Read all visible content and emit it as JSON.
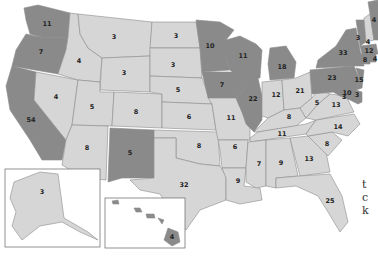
{
  "map": {
    "type": "US electoral votes by state",
    "colors": {
      "dark": "#8a8a8a",
      "light": "#d6d6d6",
      "border": "#8c8c8c",
      "label": "#222222"
    },
    "states": [
      {
        "id": "WA",
        "votes": "11",
        "shade": "dark"
      },
      {
        "id": "OR",
        "votes": "7",
        "shade": "dark"
      },
      {
        "id": "CA",
        "votes": "54",
        "shade": "dark"
      },
      {
        "id": "ID",
        "votes": "4",
        "shade": "light"
      },
      {
        "id": "NV",
        "votes": "4",
        "shade": "light"
      },
      {
        "id": "MT",
        "votes": "3",
        "shade": "light"
      },
      {
        "id": "WY",
        "votes": "3",
        "shade": "light"
      },
      {
        "id": "UT",
        "votes": "5",
        "shade": "light"
      },
      {
        "id": "AZ",
        "votes": "8",
        "shade": "light"
      },
      {
        "id": "CO",
        "votes": "8",
        "shade": "light"
      },
      {
        "id": "NM",
        "votes": "5",
        "shade": "dark"
      },
      {
        "id": "ND",
        "votes": "3",
        "shade": "light"
      },
      {
        "id": "SD",
        "votes": "3",
        "shade": "light"
      },
      {
        "id": "NE",
        "votes": "5",
        "shade": "light"
      },
      {
        "id": "KS",
        "votes": "6",
        "shade": "light"
      },
      {
        "id": "OK",
        "votes": "8",
        "shade": "light"
      },
      {
        "id": "TX",
        "votes": "32",
        "shade": "light"
      },
      {
        "id": "MN",
        "votes": "10",
        "shade": "dark"
      },
      {
        "id": "IA",
        "votes": "7",
        "shade": "dark"
      },
      {
        "id": "MO",
        "votes": "11",
        "shade": "light"
      },
      {
        "id": "AR",
        "votes": "6",
        "shade": "light"
      },
      {
        "id": "LA",
        "votes": "9",
        "shade": "light"
      },
      {
        "id": "WI",
        "votes": "11",
        "shade": "dark"
      },
      {
        "id": "IL",
        "votes": "22",
        "shade": "dark"
      },
      {
        "id": "MI",
        "votes": "18",
        "shade": "dark"
      },
      {
        "id": "IN",
        "votes": "12",
        "shade": "light"
      },
      {
        "id": "OH",
        "votes": "21",
        "shade": "light"
      },
      {
        "id": "KY",
        "votes": "8",
        "shade": "light"
      },
      {
        "id": "TN",
        "votes": "11",
        "shade": "light"
      },
      {
        "id": "MS",
        "votes": "7",
        "shade": "light"
      },
      {
        "id": "AL",
        "votes": "9",
        "shade": "light"
      },
      {
        "id": "GA",
        "votes": "13",
        "shade": "light"
      },
      {
        "id": "FL",
        "votes": "25",
        "shade": "light"
      },
      {
        "id": "SC",
        "votes": "8",
        "shade": "light"
      },
      {
        "id": "NC",
        "votes": "14",
        "shade": "light"
      },
      {
        "id": "VA",
        "votes": "13",
        "shade": "light"
      },
      {
        "id": "WV",
        "votes": "5",
        "shade": "light"
      },
      {
        "id": "PA",
        "votes": "23",
        "shade": "dark"
      },
      {
        "id": "NY",
        "votes": "33",
        "shade": "dark"
      },
      {
        "id": "VT",
        "votes": "3",
        "shade": "dark"
      },
      {
        "id": "NH",
        "votes": "4",
        "shade": "light"
      },
      {
        "id": "ME",
        "votes": "4",
        "shade": "dark"
      },
      {
        "id": "MA",
        "votes": "12",
        "shade": "dark"
      },
      {
        "id": "RI",
        "votes": "4",
        "shade": "dark"
      },
      {
        "id": "CT",
        "votes": "8",
        "shade": "dark"
      },
      {
        "id": "NJ",
        "votes": "15",
        "shade": "dark"
      },
      {
        "id": "DE",
        "votes": "3",
        "shade": "dark"
      },
      {
        "id": "MD",
        "votes": "10",
        "shade": "dark"
      },
      {
        "id": "DC",
        "votes": "3",
        "shade": "dark"
      },
      {
        "id": "AK",
        "votes": "3",
        "shade": "light"
      },
      {
        "id": "HI",
        "votes": "4",
        "shade": "dark"
      }
    ]
  },
  "side_text": {
    "line1": "t",
    "line2": "c",
    "line3": "k"
  }
}
